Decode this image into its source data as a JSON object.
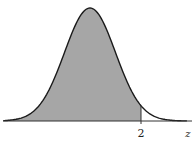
{
  "chart_data": {
    "type": "area",
    "title": "",
    "xlabel": "z",
    "ylabel": "",
    "distribution": {
      "name": "standard normal",
      "mean": 0,
      "sd": 1
    },
    "shaded_region": {
      "from": "-inf",
      "to": 2
    },
    "tick_labels": [
      {
        "value": 2,
        "label": "2"
      }
    ],
    "xlim": [
      -3.4,
      3.8
    ],
    "grid": false,
    "legend": null,
    "colors": {
      "fill": "#a6a6a6",
      "curve": "#1a1a1a",
      "axis": "#333333"
    }
  },
  "labels": {
    "tick": "2",
    "axis": "z"
  }
}
